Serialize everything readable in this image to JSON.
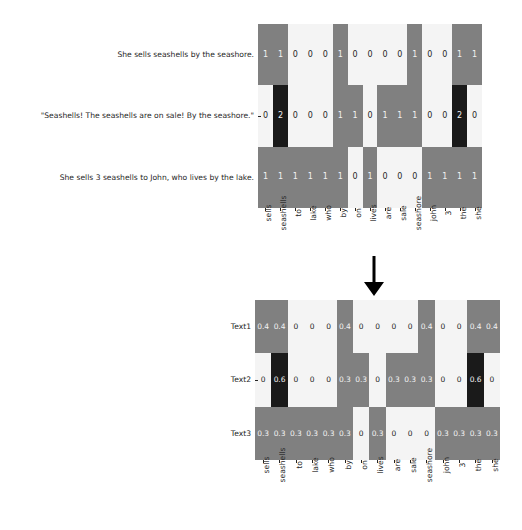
{
  "figure": {
    "title": "",
    "arrow_icon": "down-arrow-icon"
  },
  "colors": {
    "zero": "#f4f4f4",
    "mid": "#808080",
    "high": "#1a1a1a",
    "text_dark": "#262626",
    "text_light": "#f2f2f2",
    "background": "#ffffff"
  },
  "chart_data": [
    {
      "type": "heatmap",
      "name": "raw-count-heatmap",
      "title": "",
      "xlabel": "",
      "ylabel": "",
      "categories": [
        "sells",
        "seashells",
        "to",
        "lake",
        "who",
        "by",
        "on",
        "lives",
        "are",
        "sale",
        "seashore",
        "john",
        "3",
        "the",
        "she"
      ],
      "rows": [
        "She sells seashells by the seashore.",
        "\"Seashells! The seashells are on sale! By the seashore.\"",
        "She sells 3 seashells to John, who lives by the lake."
      ],
      "values": [
        [
          1,
          1,
          0,
          0,
          0,
          1,
          0,
          0,
          0,
          0,
          1,
          0,
          0,
          1,
          1
        ],
        [
          0,
          2,
          0,
          0,
          0,
          1,
          1,
          0,
          1,
          1,
          1,
          0,
          0,
          2,
          0
        ],
        [
          1,
          1,
          1,
          1,
          1,
          1,
          0,
          1,
          0,
          0,
          0,
          1,
          1,
          1,
          1
        ]
      ],
      "annot": [
        [
          "1",
          "1",
          "0",
          "0",
          "0",
          "1",
          "0",
          "0",
          "0",
          "0",
          "1",
          "0",
          "0",
          "1",
          "1"
        ],
        [
          "0",
          "2",
          "0",
          "0",
          "0",
          "1",
          "1",
          "0",
          "1",
          "1",
          "1",
          "0",
          "0",
          "2",
          "0"
        ],
        [
          "1",
          "1",
          "1",
          "1",
          "1",
          "1",
          "0",
          "1",
          "0",
          "0",
          "0",
          "1",
          "1",
          "1",
          "1"
        ]
      ],
      "vmin": 0,
      "vmax": 2,
      "grid": false,
      "legend": "none"
    },
    {
      "type": "heatmap",
      "name": "normalized-heatmap",
      "title": "",
      "xlabel": "",
      "ylabel": "",
      "categories": [
        "sells",
        "seashells",
        "to",
        "lake",
        "who",
        "by",
        "on",
        "lives",
        "are",
        "sale",
        "seashore",
        "john",
        "3",
        "the",
        "she"
      ],
      "rows": [
        "Text1",
        "Text2",
        "Text3"
      ],
      "values": [
        [
          0.4,
          0.4,
          0,
          0,
          0,
          0.4,
          0,
          0,
          0,
          0,
          0.4,
          0,
          0,
          0.4,
          0.4
        ],
        [
          0,
          0.6,
          0,
          0,
          0,
          0.3,
          0.3,
          0,
          0.3,
          0.3,
          0.3,
          0,
          0,
          0.6,
          0
        ],
        [
          0.3,
          0.3,
          0.3,
          0.3,
          0.3,
          0.3,
          0,
          0.3,
          0,
          0,
          0,
          0.3,
          0.3,
          0.3,
          0.3
        ]
      ],
      "annot": [
        [
          "0.4",
          "0.4",
          "0",
          "0",
          "0",
          "0.4",
          "0",
          "0",
          "0",
          "0",
          "0.4",
          "0",
          "0",
          "0.4",
          "0.4"
        ],
        [
          "0",
          "0.6",
          "0",
          "0",
          "0",
          "0.3",
          "0.3",
          "0",
          "0.3",
          "0.3",
          "0.3",
          "0",
          "0",
          "0.6",
          "0"
        ],
        [
          "0.3",
          "0.3",
          "0.3",
          "0.3",
          "0.3",
          "0.3",
          "0",
          "0.3",
          "0",
          "0",
          "0",
          "0.3",
          "0.3",
          "0.3",
          "0.3"
        ]
      ],
      "vmin": 0,
      "vmax": 0.6,
      "grid": false,
      "legend": "none"
    }
  ]
}
